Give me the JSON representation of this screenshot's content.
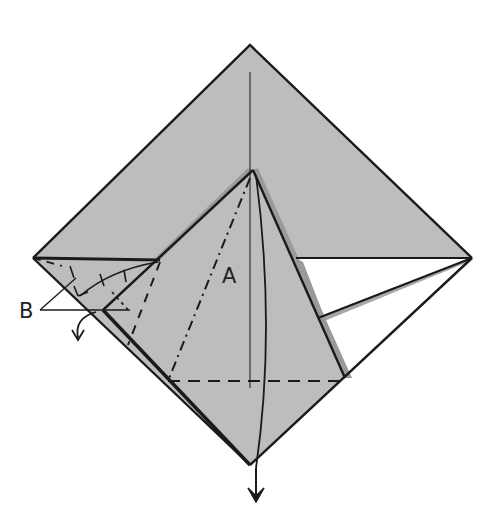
{
  "diagram": {
    "type": "origami-fold-step",
    "labels": {
      "a": "A",
      "b": "B"
    },
    "colors": {
      "paper": "#bdbdbd",
      "paper_shadow": "#9a9a9a",
      "white_flap": "#ffffff",
      "line": "#1a1a1a",
      "background": "#ffffff"
    },
    "annotations": [
      {
        "id": "A",
        "description": "dash-dot valley fold line from top of central flap to lower-left of dashed crease"
      },
      {
        "id": "B",
        "description": "two pointer lines indicating small flaps on the left corner"
      }
    ],
    "arrows": [
      {
        "id": "pull-down-arrow",
        "description": "arrow pointing down from bottom corner"
      },
      {
        "id": "fold-left-arrow",
        "description": "curved arrow folding left flap down"
      }
    ]
  }
}
